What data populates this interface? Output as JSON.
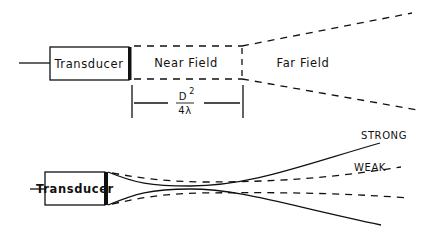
{
  "top_diagram": {
    "transducer_label": "Transducer",
    "near_field_label": "Near Field",
    "far_field_label": "Far Field",
    "distance_formula": {
      "numerator": "D",
      "exponent": "2",
      "denominator": "4λ"
    }
  },
  "bottom_diagram": {
    "transducer_label": "Transducer",
    "strong_label": "STRONG",
    "weak_label": "WEAK"
  },
  "colors": {
    "ink": "#111111",
    "background": "#ffffff"
  }
}
